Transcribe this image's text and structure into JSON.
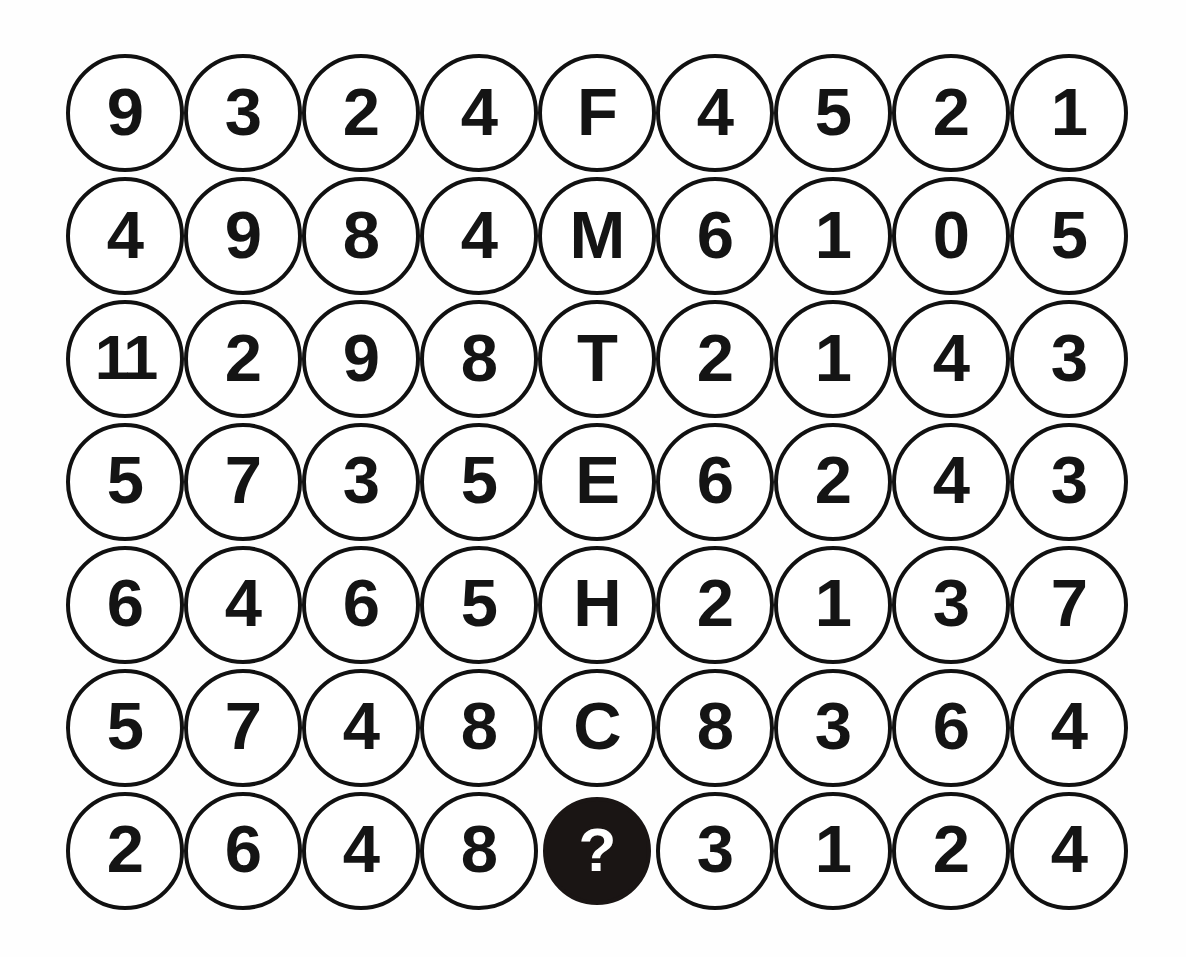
{
  "puzzle": {
    "type": "number-grid-puzzle",
    "rows": 7,
    "columns": 9,
    "background_color": "#fefefe",
    "circle_outline_color": "#111111",
    "circle_fill_color": "#ffffff",
    "text_color": "#141414",
    "highlight_fill_color": "#1a1514",
    "highlight_text_color": "#ffffff",
    "missing_marker": "?",
    "grid": [
      [
        "9",
        "3",
        "2",
        "4",
        "F",
        "4",
        "5",
        "2",
        "1"
      ],
      [
        "4",
        "9",
        "8",
        "4",
        "M",
        "6",
        "1",
        "0",
        "5"
      ],
      [
        "11",
        "2",
        "9",
        "8",
        "T",
        "2",
        "1",
        "4",
        "3"
      ],
      [
        "5",
        "7",
        "3",
        "5",
        "E",
        "6",
        "2",
        "4",
        "3"
      ],
      [
        "6",
        "4",
        "6",
        "5",
        "H",
        "2",
        "1",
        "3",
        "7"
      ],
      [
        "5",
        "7",
        "4",
        "8",
        "C",
        "8",
        "3",
        "6",
        "4"
      ],
      [
        "2",
        "6",
        "4",
        "8",
        "?",
        "3",
        "1",
        "2",
        "4"
      ]
    ],
    "highlighted_cells": [
      {
        "row": 6,
        "col": 4
      }
    ]
  }
}
